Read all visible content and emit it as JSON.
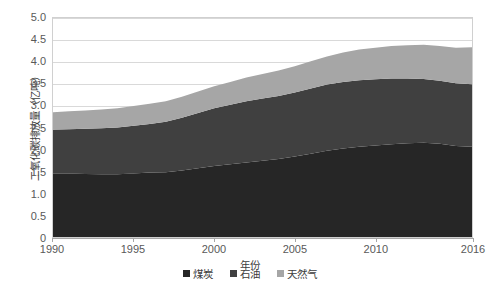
{
  "chart_data": {
    "type": "area",
    "stacked": true,
    "title": "",
    "xlabel": "年份",
    "ylabel": "二氧化碳排放量（亿吨）",
    "xlim": [
      1990,
      2016
    ],
    "ylim": [
      0,
      5.0
    ],
    "grid": true,
    "legend_position": "bottom",
    "x": [
      1990,
      1991,
      1992,
      1993,
      1994,
      1995,
      1996,
      1997,
      1998,
      1999,
      2000,
      2001,
      2002,
      2003,
      2004,
      2005,
      2006,
      2007,
      2008,
      2009,
      2010,
      2011,
      2012,
      2013,
      2014,
      2015,
      2016
    ],
    "xticks": [
      "1990",
      "1995",
      "2000",
      "2005",
      "2010",
      "2016"
    ],
    "xtick_values": [
      1990,
      1995,
      2000,
      2005,
      2010,
      2016
    ],
    "yticks": [
      "0",
      "0.5",
      "1.0",
      "1.5",
      "2.0",
      "2.5",
      "3.0",
      "3.5",
      "4.0",
      "4.5",
      "5.0"
    ],
    "ytick_values": [
      0,
      0.5,
      1.0,
      1.5,
      2.0,
      2.5,
      3.0,
      3.5,
      4.0,
      4.5,
      5.0
    ],
    "series": [
      {
        "name": "煤炭",
        "color": "#262626",
        "values": [
          1.45,
          1.45,
          1.44,
          1.43,
          1.43,
          1.45,
          1.47,
          1.48,
          1.52,
          1.57,
          1.62,
          1.66,
          1.7,
          1.74,
          1.78,
          1.84,
          1.9,
          1.97,
          2.02,
          2.06,
          2.09,
          2.12,
          2.14,
          2.15,
          2.13,
          2.08,
          2.06
        ]
      },
      {
        "name": "石油",
        "color": "#404040",
        "values": [
          1.0,
          1.01,
          1.03,
          1.05,
          1.07,
          1.09,
          1.11,
          1.15,
          1.2,
          1.26,
          1.32,
          1.36,
          1.4,
          1.42,
          1.44,
          1.46,
          1.49,
          1.51,
          1.52,
          1.52,
          1.51,
          1.5,
          1.48,
          1.46,
          1.44,
          1.43,
          1.43
        ]
      },
      {
        "name": "天然气",
        "color": "#a6a6a6",
        "values": [
          0.4,
          0.41,
          0.42,
          0.43,
          0.44,
          0.45,
          0.46,
          0.47,
          0.48,
          0.49,
          0.5,
          0.52,
          0.54,
          0.56,
          0.58,
          0.6,
          0.62,
          0.64,
          0.67,
          0.7,
          0.72,
          0.74,
          0.76,
          0.78,
          0.79,
          0.81,
          0.84
        ]
      }
    ],
    "totals": [
      2.85,
      2.87,
      2.89,
      2.91,
      2.94,
      2.99,
      3.04,
      3.1,
      3.2,
      3.32,
      3.44,
      3.54,
      3.64,
      3.72,
      3.8,
      3.9,
      4.01,
      4.12,
      4.21,
      4.28,
      4.32,
      4.36,
      4.38,
      4.39,
      4.36,
      4.32,
      4.33
    ]
  },
  "legend": {
    "items": [
      {
        "label": "煤炭",
        "color": "#262626"
      },
      {
        "label": "石油",
        "color": "#404040"
      },
      {
        "label": "天然气",
        "color": "#a6a6a6"
      }
    ]
  },
  "axes": {
    "y_title": "二氧化碳排放量（亿吨）",
    "x_title": "年份"
  }
}
